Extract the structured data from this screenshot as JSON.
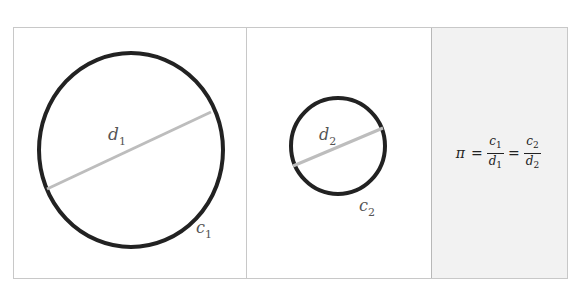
{
  "diagram": {
    "panels": [
      {
        "id": "large-circle",
        "circle_label": "c",
        "circle_subscript": "1",
        "diameter_label": "d",
        "diameter_subscript": "1"
      },
      {
        "id": "small-circle",
        "circle_label": "c",
        "circle_subscript": "2",
        "diameter_label": "d",
        "diameter_subscript": "2"
      },
      {
        "id": "formula",
        "pi": "π",
        "equals": "=",
        "frac1_num": "c",
        "frac1_num_sub": "1",
        "frac1_den": "d",
        "frac1_den_sub": "1",
        "frac2_num": "c",
        "frac2_num_sub": "2",
        "frac2_den": "d",
        "frac2_den_sub": "2"
      }
    ],
    "colors": {
      "circle_stroke": "#222222",
      "diameter_stroke": "#bdbdbd",
      "frame_border": "#c8c8c8",
      "formula_panel_bg": "#f2f2f2"
    }
  }
}
